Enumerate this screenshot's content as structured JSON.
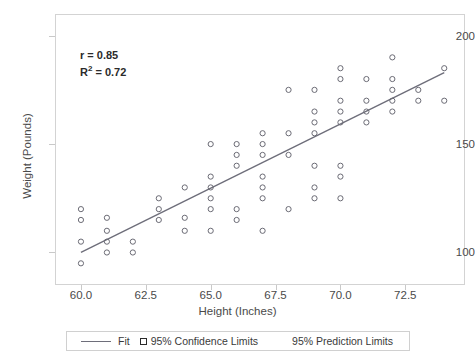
{
  "title_strip": "",
  "annotation": {
    "r_label": "r = 0.85",
    "r2_prefix": "R",
    "r2_sup": "2",
    "r2_value": " = 0.72"
  },
  "axes": {
    "xlabel": "Height (Inches)",
    "ylabel": "Weight (Pounds)",
    "xticks": [
      "60.0",
      "62.5",
      "65.0",
      "67.5",
      "70.0",
      "72.5"
    ],
    "yticks": [
      "100",
      "150",
      "200"
    ]
  },
  "legend": {
    "fit": "Fit",
    "confidence": "95% Confidence Limits",
    "prediction": "95% Prediction Limits"
  },
  "colors": {
    "fit_line": "#6e6e7a",
    "marker_stroke": "#6b6b75",
    "frame": "#d3d3d3",
    "text": "#4a4a4a"
  },
  "chart_data": {
    "type": "scatter",
    "title": "",
    "xlabel": "Height (Inches)",
    "ylabel": "Weight (Pounds)",
    "xlim": [
      59.0,
      74.8
    ],
    "ylim": [
      85,
      210
    ],
    "xticks": [
      60.0,
      62.5,
      65.0,
      67.5,
      70.0,
      72.5
    ],
    "yticks": [
      100,
      150,
      200
    ],
    "grid": false,
    "legend_position": "below",
    "annotations": {
      "r": 0.85,
      "r_squared": 0.72
    },
    "series": [
      {
        "name": "Observations",
        "marker": "open-circle",
        "points": [
          [
            60,
            95
          ],
          [
            60,
            105
          ],
          [
            60,
            115
          ],
          [
            60,
            120
          ],
          [
            61,
            100
          ],
          [
            61,
            105
          ],
          [
            61,
            110
          ],
          [
            61,
            116
          ],
          [
            62,
            100
          ],
          [
            62,
            105
          ],
          [
            63,
            115
          ],
          [
            63,
            120
          ],
          [
            63,
            125
          ],
          [
            64,
            110
          ],
          [
            64,
            116
          ],
          [
            64,
            130
          ],
          [
            65,
            110
          ],
          [
            65,
            120
          ],
          [
            65,
            125
          ],
          [
            65,
            130
          ],
          [
            65,
            135
          ],
          [
            65,
            150
          ],
          [
            66,
            115
          ],
          [
            66,
            120
          ],
          [
            66,
            140
          ],
          [
            66,
            145
          ],
          [
            66,
            150
          ],
          [
            67,
            110
          ],
          [
            67,
            125
          ],
          [
            67,
            130
          ],
          [
            67,
            135
          ],
          [
            67,
            145
          ],
          [
            67,
            150
          ],
          [
            67,
            155
          ],
          [
            68,
            120
          ],
          [
            68,
            145
          ],
          [
            68,
            155
          ],
          [
            68,
            175
          ],
          [
            69,
            125
          ],
          [
            69,
            130
          ],
          [
            69,
            140
          ],
          [
            69,
            155
          ],
          [
            69,
            160
          ],
          [
            69,
            165
          ],
          [
            69,
            175
          ],
          [
            70,
            125
          ],
          [
            70,
            135
          ],
          [
            70,
            140
          ],
          [
            70,
            160
          ],
          [
            70,
            165
          ],
          [
            70,
            170
          ],
          [
            70,
            180
          ],
          [
            70,
            185
          ],
          [
            71,
            160
          ],
          [
            71,
            165
          ],
          [
            71,
            170
          ],
          [
            71,
            180
          ],
          [
            72,
            165
          ],
          [
            72,
            170
          ],
          [
            72,
            175
          ],
          [
            72,
            180
          ],
          [
            72,
            190
          ],
          [
            73,
            170
          ],
          [
            73,
            175
          ],
          [
            74,
            170
          ],
          [
            74,
            185
          ]
        ]
      },
      {
        "name": "Fit",
        "type": "line",
        "x": [
          60,
          74
        ],
        "y": [
          100,
          183
        ]
      }
    ]
  }
}
